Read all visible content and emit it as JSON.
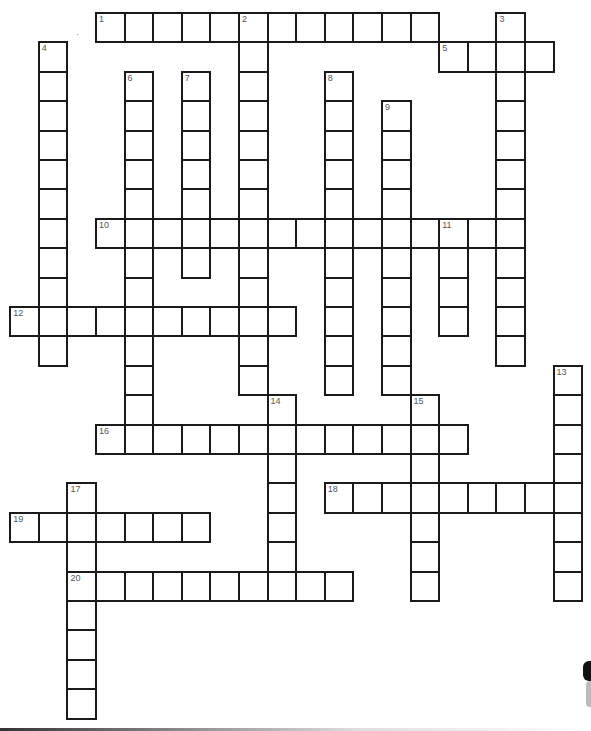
{
  "puzzle": {
    "type": "crossword",
    "grid": {
      "origin_x": 10.2,
      "origin_y": 13,
      "cell_w": 28.6,
      "cell_h": 29.4,
      "border_color": "#1a1a1a",
      "number_color": "#555555"
    },
    "entries": [
      {
        "num": "1",
        "dir": "across",
        "col": 3,
        "row": 0,
        "len": 12
      },
      {
        "num": "2",
        "dir": "down",
        "col": 8,
        "row": 0,
        "len": 13
      },
      {
        "num": "3",
        "dir": "down",
        "col": 17,
        "row": 0,
        "len": 12
      },
      {
        "num": "4",
        "dir": "down",
        "col": 1,
        "row": 1,
        "len": 11
      },
      {
        "num": "5",
        "dir": "across",
        "col": 15,
        "row": 1,
        "len": 4
      },
      {
        "num": "6",
        "dir": "down",
        "col": 4,
        "row": 2,
        "len": 13
      },
      {
        "num": "7",
        "dir": "down",
        "col": 6,
        "row": 2,
        "len": 7
      },
      {
        "num": "8",
        "dir": "down",
        "col": 11,
        "row": 2,
        "len": 11
      },
      {
        "num": "9",
        "dir": "down",
        "col": 13,
        "row": 3,
        "len": 10
      },
      {
        "num": "10",
        "dir": "across",
        "col": 3,
        "row": 7,
        "len": 15
      },
      {
        "num": "11",
        "dir": "down",
        "col": 15,
        "row": 7,
        "len": 4
      },
      {
        "num": "12",
        "dir": "across",
        "col": 0,
        "row": 10,
        "len": 10
      },
      {
        "num": "13",
        "dir": "down",
        "col": 19,
        "row": 12,
        "len": 8
      },
      {
        "num": "14",
        "dir": "down",
        "col": 9,
        "row": 13,
        "len": 7
      },
      {
        "num": "15",
        "dir": "down",
        "col": 14,
        "row": 13,
        "len": 7
      },
      {
        "num": "16",
        "dir": "across",
        "col": 3,
        "row": 14,
        "len": 13
      },
      {
        "num": "17",
        "dir": "down",
        "col": 2,
        "row": 16,
        "len": 8
      },
      {
        "num": "18",
        "dir": "across",
        "col": 11,
        "row": 16,
        "len": 9
      },
      {
        "num": "19",
        "dir": "across",
        "col": 0,
        "row": 17,
        "len": 7
      },
      {
        "num": "20",
        "dir": "across",
        "col": 2,
        "row": 19,
        "len": 10
      }
    ]
  }
}
